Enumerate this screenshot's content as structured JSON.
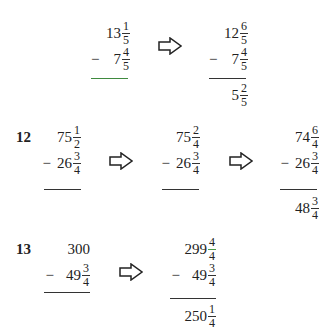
{
  "problems": [
    {
      "label": "",
      "steps": [
        {
          "top": {
            "whole": "13",
            "num": "1",
            "den": "5"
          },
          "bottom": {
            "whole": "7",
            "num": "4",
            "den": "5"
          },
          "result": null
        },
        {
          "top": {
            "whole": "12",
            "num": "6",
            "den": "5"
          },
          "bottom": {
            "whole": "7",
            "num": "4",
            "den": "5"
          },
          "result": {
            "whole": "5",
            "num": "2",
            "den": "5"
          }
        }
      ]
    },
    {
      "label": "12",
      "steps": [
        {
          "top": {
            "whole": "75",
            "num": "1",
            "den": "2"
          },
          "bottom": {
            "whole": "26",
            "num": "3",
            "den": "4"
          },
          "result": null
        },
        {
          "top": {
            "whole": "75",
            "num": "2",
            "den": "4"
          },
          "bottom": {
            "whole": "26",
            "num": "3",
            "den": "4"
          },
          "result": null
        },
        {
          "top": {
            "whole": "74",
            "num": "6",
            "den": "4"
          },
          "bottom": {
            "whole": "26",
            "num": "3",
            "den": "4"
          },
          "result": {
            "whole": "48",
            "num": "3",
            "den": "4"
          }
        }
      ]
    },
    {
      "label": "13",
      "steps": [
        {
          "top": {
            "whole": "300",
            "num": "",
            "den": ""
          },
          "bottom": {
            "whole": "49",
            "num": "3",
            "den": "4"
          },
          "result": null
        },
        {
          "top": {
            "whole": "299",
            "num": "4",
            "den": "4"
          },
          "bottom": {
            "whole": "49",
            "num": "3",
            "den": "4"
          },
          "result": {
            "whole": "250",
            "num": "1",
            "den": "4"
          }
        }
      ]
    }
  ],
  "symbols": {
    "minus": "−",
    "arrow": "right-outline-arrow"
  },
  "colors": {
    "ink": "#222222",
    "accent_rule": "#3f8a3f"
  }
}
